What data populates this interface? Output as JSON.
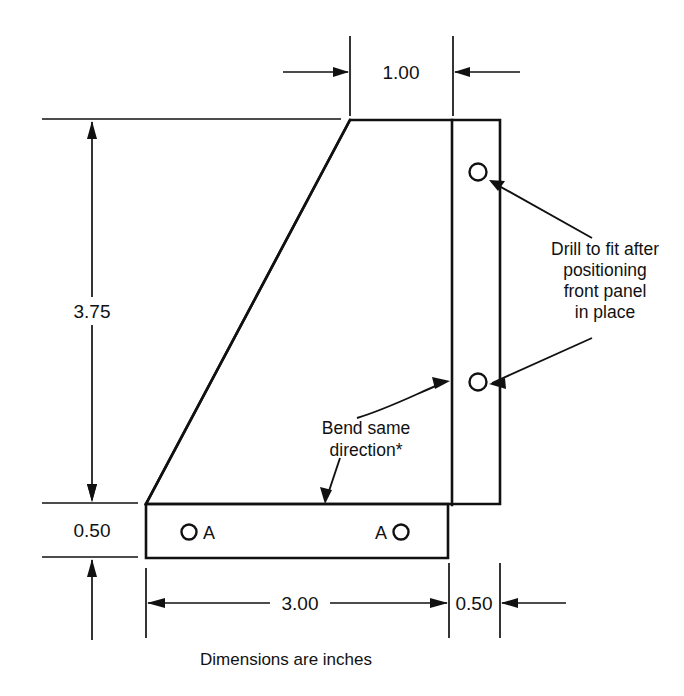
{
  "drawing": {
    "title": "Sheet metal bracket detail drawing",
    "caption": "Dimensions are inches",
    "units": "inches",
    "line_color": "#111111",
    "background_color": "#ffffff",
    "dimensions": [
      {
        "id": "top-width",
        "label": "1.00",
        "orientation": "horizontal"
      },
      {
        "id": "left-height",
        "label": "3.75",
        "orientation": "vertical"
      },
      {
        "id": "bottom-flange-height",
        "label": "0.50",
        "orientation": "vertical"
      },
      {
        "id": "base-width",
        "label": "3.00",
        "orientation": "horizontal"
      },
      {
        "id": "right-flange-width",
        "label": "0.50",
        "orientation": "horizontal"
      }
    ],
    "notes": [
      {
        "id": "drill-note",
        "lines": [
          "Drill to fit after",
          "positioning",
          "front panel",
          "in place"
        ]
      },
      {
        "id": "bend-note",
        "lines": [
          "Bend same",
          "direction*"
        ]
      }
    ],
    "hole_labels": {
      "left": "A",
      "right": "A"
    },
    "holes": [
      {
        "id": "right-panel-hole-upper",
        "cx": 478,
        "cy": 172,
        "r": 8.5
      },
      {
        "id": "right-panel-hole-lower",
        "cx": 478,
        "cy": 382,
        "r": 8.5
      },
      {
        "id": "base-hole-left",
        "cx": 189,
        "cy": 532,
        "r": 7.5
      },
      {
        "id": "base-hole-right",
        "cx": 401,
        "cy": 532,
        "r": 7.5
      }
    ]
  }
}
